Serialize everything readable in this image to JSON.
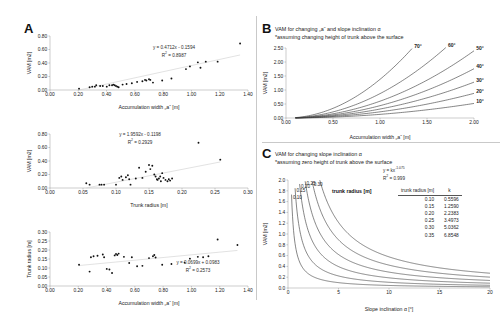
{
  "figure": {
    "panels": [
      {
        "letter": "A"
      },
      {
        "letter": "B"
      },
      {
        "letter": "C"
      }
    ]
  },
  "panelA": {
    "letter": "A",
    "charts": [
      {
        "id": "a1",
        "equation": "y = 0.4712x - 0.1594",
        "r2_label": "R",
        "r2_sup": "2",
        "r2_value": " = 0.8987",
        "xlabel": "Accumulation width „a“ [m]",
        "ylabel": "VAM [m2]"
      },
      {
        "id": "a2",
        "equation": "y = 1.9592x - 0.1198",
        "r2_label": "R",
        "r2_sup": "2",
        "r2_value": " = 0.2929",
        "xlabel": "Trunk radius [m]",
        "ylabel": "VAM [m2]"
      },
      {
        "id": "a3",
        "equation": "y = 0.0699x + 0.0983",
        "r2_label": "R",
        "r2_sup": "2",
        "r2_value": " = 0.2573",
        "xlabel": "Accumulation width „a“ [m]",
        "ylabel": "Trunk radius [m]"
      }
    ]
  },
  "panelB": {
    "letter": "B",
    "title_line1": "VAM for changing „a“ and slope inclination α",
    "title_line2": "*assuming changing height of trunk above the surface",
    "xlabel": "Accumulation width „a“ [m]",
    "ylabel": "VAM [m2]"
  },
  "panelC": {
    "letter": "C",
    "title_line1": "VAM for changing slope inclination α",
    "title_line2": "*assuming zero height of trunk above the surface",
    "equation": "y = kx",
    "equation_exp": "-1.075",
    "r2_label": "R",
    "r2_sup": "2",
    "r2_value": " = 0.999",
    "xlabel": "Slope inclination α [°]",
    "ylabel": "VAM [m2]",
    "inline_caption": "trunk radius [m]",
    "table": {
      "headers": [
        "trunk radius [m]",
        "k"
      ],
      "rows": [
        [
          "0.10",
          "0.5596"
        ],
        [
          "0.15",
          "1.2590"
        ],
        [
          "0.20",
          "2.2383"
        ],
        [
          "0.25",
          "3.4973"
        ],
        [
          "0.30",
          "5.0362"
        ],
        [
          "0.35",
          "6.8548"
        ]
      ]
    }
  },
  "chart_data": [
    {
      "type": "scatter",
      "id": "A-top",
      "title": "",
      "xlabel": "Accumulation width „a“ [m]",
      "ylabel": "VAM [m2]",
      "xlim": [
        0.0,
        1.5
      ],
      "ylim": [
        0.0,
        0.8
      ],
      "xticks": [
        "0.00",
        "0.20",
        "0.40",
        "0.60",
        "0.80",
        "1.00",
        "1.20",
        "1.40"
      ],
      "yticks": [
        "0.00",
        "0.20",
        "0.40",
        "0.60",
        "0.80"
      ],
      "grid": false,
      "trendline": {
        "slope": 0.4712,
        "intercept": -0.1594,
        "r2": 0.8987
      },
      "points": [
        [
          0.22,
          0.02
        ],
        [
          0.3,
          0.04
        ],
        [
          0.32,
          0.05
        ],
        [
          0.34,
          0.05
        ],
        [
          0.35,
          0.07
        ],
        [
          0.38,
          0.06
        ],
        [
          0.4,
          0.06
        ],
        [
          0.43,
          0.05
        ],
        [
          0.45,
          0.07
        ],
        [
          0.47,
          0.07
        ],
        [
          0.48,
          0.08
        ],
        [
          0.49,
          0.07
        ],
        [
          0.5,
          0.06
        ],
        [
          0.51,
          0.05
        ],
        [
          0.52,
          0.04
        ],
        [
          0.55,
          0.08
        ],
        [
          0.58,
          0.09
        ],
        [
          0.62,
          0.1
        ],
        [
          0.66,
          0.12
        ],
        [
          0.7,
          0.13
        ],
        [
          0.72,
          0.15
        ],
        [
          0.73,
          0.14
        ],
        [
          0.75,
          0.16
        ],
        [
          0.76,
          0.15
        ],
        [
          0.78,
          0.11
        ],
        [
          0.85,
          0.14
        ],
        [
          0.92,
          0.17
        ],
        [
          1.03,
          0.31
        ],
        [
          1.06,
          0.35
        ],
        [
          1.12,
          0.41
        ],
        [
          1.14,
          0.33
        ],
        [
          1.18,
          0.42
        ],
        [
          1.27,
          0.42
        ],
        [
          1.44,
          0.69
        ]
      ]
    },
    {
      "type": "scatter",
      "id": "A-middle",
      "title": "",
      "xlabel": "Trunk radius [m]",
      "ylabel": "VAM [m2]",
      "xlim": [
        0.0,
        0.3
      ],
      "ylim": [
        0.0,
        0.8
      ],
      "xticks": [
        "0.00",
        "0.05",
        "0.10",
        "0.15",
        "0.20",
        "0.25",
        "0.30"
      ],
      "yticks": [
        "0.00",
        "0.20",
        "0.40",
        "0.60",
        "0.80"
      ],
      "grid": false,
      "trendline": {
        "slope": 1.9592,
        "intercept": -0.1198,
        "r2": 0.2929
      },
      "points": [
        [
          0.055,
          0.07
        ],
        [
          0.06,
          0.05
        ],
        [
          0.075,
          0.05
        ],
        [
          0.078,
          0.05
        ],
        [
          0.082,
          0.05
        ],
        [
          0.1,
          0.05
        ],
        [
          0.105,
          0.15
        ],
        [
          0.108,
          0.17
        ],
        [
          0.11,
          0.12
        ],
        [
          0.115,
          0.16
        ],
        [
          0.118,
          0.19
        ],
        [
          0.12,
          0.13
        ],
        [
          0.122,
          0.05
        ],
        [
          0.13,
          0.14
        ],
        [
          0.135,
          0.3
        ],
        [
          0.14,
          0.15
        ],
        [
          0.145,
          0.24
        ],
        [
          0.15,
          0.34
        ],
        [
          0.152,
          0.28
        ],
        [
          0.155,
          0.33
        ],
        [
          0.158,
          0.2
        ],
        [
          0.16,
          0.17
        ],
        [
          0.162,
          0.13
        ],
        [
          0.163,
          0.12
        ],
        [
          0.165,
          0.14
        ],
        [
          0.167,
          0.17
        ],
        [
          0.168,
          0.1
        ],
        [
          0.17,
          0.22
        ],
        [
          0.172,
          0.15
        ],
        [
          0.175,
          0.12
        ],
        [
          0.178,
          0.1
        ],
        [
          0.18,
          0.13
        ],
        [
          0.182,
          0.11
        ],
        [
          0.185,
          0.14
        ],
        [
          0.225,
          0.67
        ],
        [
          0.258,
          0.42
        ]
      ]
    },
    {
      "type": "scatter",
      "id": "A-bottom",
      "title": "",
      "xlabel": "Accumulation width „a“ [m]",
      "ylabel": "Trunk radius [m]",
      "xlim": [
        0.0,
        1.5
      ],
      "ylim": [
        0.0,
        0.3
      ],
      "xticks": [
        "0.00",
        "0.20",
        "0.40",
        "0.60",
        "0.80",
        "1.00",
        "1.20",
        "1.40"
      ],
      "yticks": [
        "0.00",
        "0.05",
        "0.10",
        "0.15",
        "0.20",
        "0.25",
        "0.30"
      ],
      "grid": false,
      "trendline": {
        "slope": 0.0699,
        "intercept": 0.0983,
        "r2": 0.2573
      },
      "points": [
        [
          0.22,
          0.118
        ],
        [
          0.3,
          0.08
        ],
        [
          0.31,
          0.16
        ],
        [
          0.33,
          0.165
        ],
        [
          0.36,
          0.168
        ],
        [
          0.4,
          0.175
        ],
        [
          0.41,
          0.16
        ],
        [
          0.43,
          0.095
        ],
        [
          0.45,
          0.092
        ],
        [
          0.47,
          0.072
        ],
        [
          0.49,
          0.17
        ],
        [
          0.5,
          0.178
        ],
        [
          0.51,
          0.172
        ],
        [
          0.52,
          0.18
        ],
        [
          0.56,
          0.162
        ],
        [
          0.6,
          0.128
        ],
        [
          0.62,
          0.16
        ],
        [
          0.66,
          0.11
        ],
        [
          0.7,
          0.112
        ],
        [
          0.75,
          0.155
        ],
        [
          0.78,
          0.165
        ],
        [
          0.79,
          0.172
        ],
        [
          0.8,
          0.158
        ],
        [
          0.85,
          0.118
        ],
        [
          0.92,
          0.122
        ],
        [
          1.02,
          0.13
        ],
        [
          1.06,
          0.152
        ],
        [
          1.12,
          0.162
        ],
        [
          1.16,
          0.16
        ],
        [
          1.2,
          0.165
        ],
        [
          1.27,
          0.258
        ],
        [
          1.42,
          0.228
        ]
      ]
    },
    {
      "type": "line",
      "id": "B",
      "title": "VAM for changing „a“ and slope inclination α",
      "subtitle": "*assuming changing height of trunk above the surface",
      "xlabel": "Accumulation width „a“ [m]",
      "ylabel": "VAM [m2]",
      "xlim": [
        0.0,
        2.0
      ],
      "ylim": [
        0.0,
        2.5
      ],
      "xticks": [
        "0.00",
        "0.50",
        "1.00",
        "1.50",
        "2.00"
      ],
      "yticks": [
        "0.00",
        "0.50",
        "1.00",
        "1.50",
        "2.00",
        "2.50"
      ],
      "grid": false,
      "legend_position": "inline-right",
      "series": [
        {
          "name": "70°",
          "coef": 1.38
        },
        {
          "name": "60°",
          "coef": 0.87
        },
        {
          "name": "50°",
          "coef": 0.6
        },
        {
          "name": "40°",
          "coef": 0.44
        },
        {
          "name": "30°",
          "coef": 0.32
        },
        {
          "name": "20°",
          "coef": 0.22
        },
        {
          "name": "10°",
          "coef": 0.13
        }
      ]
    },
    {
      "type": "line",
      "id": "C",
      "title": "VAM for changing slope inclination α",
      "subtitle": "*assuming zero height of trunk above the surface",
      "xlabel": "Slope inclination α [°]",
      "ylabel": "VAM [m2]",
      "xlim": [
        0,
        20
      ],
      "ylim": [
        0.0,
        2.0
      ],
      "xticks": [
        "0",
        "5",
        "10",
        "15",
        "20"
      ],
      "yticks": [
        "0.0",
        "0.2",
        "0.4",
        "0.6",
        "0.8",
        "1.0",
        "1.2",
        "1.4",
        "1.6",
        "1.8",
        "2.0"
      ],
      "grid": false,
      "equation": "y = kx^-1.075",
      "r2": 0.999,
      "legend_position": "inline",
      "series": [
        {
          "name": "0.35",
          "k": 6.8548
        },
        {
          "name": "0.30",
          "k": 5.0362
        },
        {
          "name": "0.25",
          "k": 3.4973
        },
        {
          "name": "0.20",
          "k": 2.2383
        },
        {
          "name": "0.15",
          "k": 1.259
        },
        {
          "name": "0.10",
          "k": 0.5596
        }
      ]
    }
  ]
}
